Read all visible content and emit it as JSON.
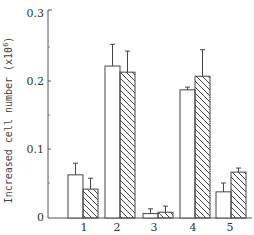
{
  "chart_data": {
    "type": "bar",
    "title": "",
    "xlabel": "",
    "ylabel": "Increased cell number (x10^6)",
    "ylabel_display": "Increased cell number (x10",
    "ylabel_exponent": "6",
    "ylim": [
      0,
      0.3
    ],
    "yticks": [
      "0",
      "0.1",
      "0.2",
      "0.3"
    ],
    "categories": [
      "1",
      "2",
      "3",
      "4",
      "5"
    ],
    "grid": false,
    "legend": null,
    "series": [
      {
        "name": "open",
        "pattern": "white",
        "values": [
          0.062,
          0.222,
          0.005,
          0.187,
          0.037
        ],
        "errors": [
          0.017,
          0.032,
          0.007,
          0.004,
          0.013
        ]
      },
      {
        "name": "hatched",
        "pattern": "diagonal-hatch",
        "values": [
          0.041,
          0.213,
          0.007,
          0.207,
          0.066
        ],
        "errors": [
          0.016,
          0.031,
          0.009,
          0.039,
          0.006
        ]
      }
    ]
  }
}
